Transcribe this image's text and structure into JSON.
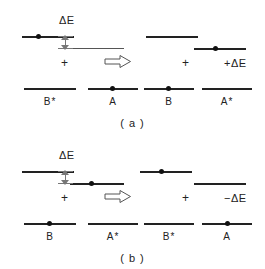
{
  "figure": {
    "type": "energy-level-transfer-diagram",
    "caption_a": "( a )",
    "caption_b": "( b )",
    "delta_label": "ΔE",
    "plus_sign": "+",
    "implies_icon": "double-right-arrow"
  },
  "panel_a": {
    "caption": "( a )",
    "reactants": {
      "left": {
        "label": "B*",
        "excited": true,
        "upper_level_has_electron": true,
        "lower_level_has_electron": false
      },
      "right": {
        "label": "A",
        "excited": false,
        "upper_level_has_electron": false,
        "lower_level_has_electron": true
      }
    },
    "products": {
      "left": {
        "label": "B",
        "excited": false,
        "upper_level_has_electron": false,
        "lower_level_has_electron": true
      },
      "right": {
        "label": "A*",
        "excited": true,
        "upper_level_has_electron": true,
        "lower_level_has_electron": false
      }
    },
    "plus_reactants": "+",
    "plus_products": "+",
    "energy_term": "+ΔE",
    "delta_label": "ΔE"
  },
  "panel_b": {
    "caption": "( b )",
    "reactants": {
      "left": {
        "label": "B",
        "excited": false,
        "upper_level_has_electron": false,
        "lower_level_has_electron": true
      },
      "right": {
        "label": "A*",
        "excited": true,
        "upper_level_has_electron": true,
        "lower_level_has_electron": false
      }
    },
    "products": {
      "left": {
        "label": "B*",
        "excited": true,
        "upper_level_has_electron": true,
        "lower_level_has_electron": false
      },
      "right": {
        "label": "A",
        "excited": false,
        "upper_level_has_electron": false,
        "lower_level_has_electron": true
      }
    },
    "plus_reactants": "+",
    "plus_products": "+",
    "energy_term": "−ΔE",
    "delta_label": "ΔE"
  },
  "colors": {
    "ink": "#222222",
    "thin_ink": "#555555",
    "arrow": "#777777",
    "background": "#ffffff"
  }
}
